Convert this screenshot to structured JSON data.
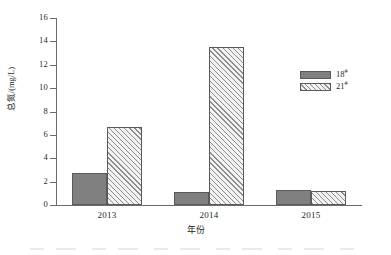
{
  "chart_data": {
    "type": "bar",
    "title": "",
    "xlabel": "年份",
    "ylabel": "总氮/(mg/L)",
    "categories": [
      "2013",
      "2014",
      "2015"
    ],
    "series": [
      {
        "name": "18#",
        "name_base": "18",
        "name_sup": "#",
        "values": [
          2.7,
          1.15,
          1.3
        ],
        "color": "#808080",
        "fill": "solid"
      },
      {
        "name": "21#",
        "name_base": "21",
        "name_sup": "#",
        "values": [
          6.7,
          13.5,
          1.2
        ],
        "color": "#f2f2f2",
        "fill": "diagonal-hatch"
      }
    ],
    "ylim": [
      0,
      16
    ],
    "yticks": [
      "0",
      "2",
      "4",
      "6",
      "8",
      "10",
      "12",
      "14",
      "16"
    ],
    "ytick_values": [
      0,
      2,
      4,
      6,
      8,
      10,
      12,
      14,
      16
    ],
    "grid": false,
    "legend_position": "top-right",
    "axis_color": "#6b6b6b"
  },
  "legend": {
    "items": [
      {
        "label": "18",
        "sup": "#"
      },
      {
        "label": "21",
        "sup": "#"
      }
    ]
  },
  "axes": {
    "y_title": "总氮/(mg/L)",
    "x_title": "年份"
  }
}
